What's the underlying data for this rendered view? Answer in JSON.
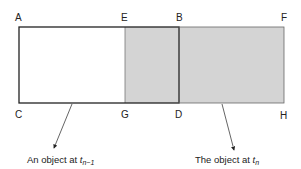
{
  "points": {
    "A": "A",
    "E": "E",
    "B": "B",
    "F": "F",
    "C": "C",
    "G": "G",
    "D": "D",
    "H": "H"
  },
  "captions": {
    "prev": {
      "text": "An object at ",
      "var": "t",
      "sub": "n−1"
    },
    "curr": {
      "text": "The object at ",
      "var": "t",
      "sub": "n"
    }
  },
  "colors": {
    "shade": "#d4d4d4",
    "stroke": "#222222",
    "light_stroke": "#777777"
  }
}
